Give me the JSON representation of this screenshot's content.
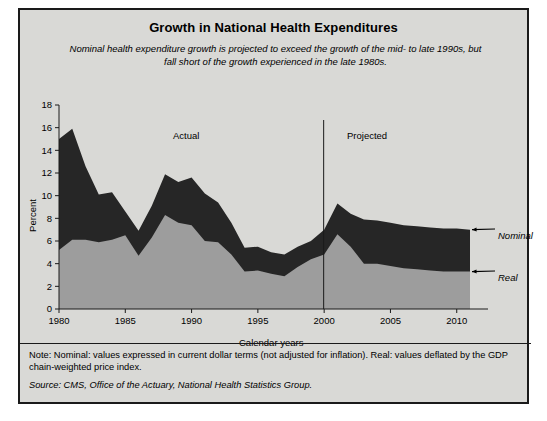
{
  "figure": {
    "title": "Growth in National Health Expenditures",
    "subtitle": "Nominal health expenditure growth is projected to exceed the growth of the mid- to late 1990s, but fall short of the growth experienced in the late 1980s.",
    "note": "Note: Nominal: values expressed in current dollar terms (not adjusted for inflation). Real: values deflated by the GDP chain-weighted price index.",
    "source": "Source: CMS, Office of the Actuary, National Health Statistics Group.",
    "background_color": "#d9d9d6",
    "border_color": "#1a1a1a"
  },
  "annotations": {
    "actual_label": "Actual",
    "projected_label": "Projected",
    "nominal_label": "Nominal",
    "real_label": "Real",
    "divider_year": 2000
  },
  "chart_data": {
    "type": "area",
    "title": "Growth in National Health Expenditures",
    "xlabel": "Calendar years",
    "ylabel": "Percent",
    "ylim": [
      0,
      18
    ],
    "xlim": [
      1980,
      2011
    ],
    "ytick_step": 2,
    "yticks": [
      0,
      2,
      4,
      6,
      8,
      10,
      12,
      14,
      16,
      18
    ],
    "xticks": [
      1980,
      1985,
      1990,
      1995,
      2000,
      2005,
      2010
    ],
    "grid": false,
    "legend": "inline-arrow-labels",
    "colors": {
      "nominal": "#262626",
      "real": "#9d9d9d"
    },
    "x": [
      1980,
      1981,
      1982,
      1983,
      1984,
      1985,
      1986,
      1987,
      1988,
      1989,
      1990,
      1991,
      1992,
      1993,
      1994,
      1995,
      1996,
      1997,
      1998,
      1999,
      2000,
      2001,
      2002,
      2003,
      2004,
      2005,
      2006,
      2007,
      2008,
      2009,
      2010,
      2011
    ],
    "series": [
      {
        "name": "Nominal",
        "values": [
          15.0,
          15.9,
          12.6,
          10.1,
          10.3,
          8.6,
          6.9,
          9.1,
          11.9,
          11.2,
          11.6,
          10.2,
          9.4,
          7.6,
          5.4,
          5.5,
          5.0,
          4.8,
          5.5,
          6.0,
          7.0,
          9.3,
          8.4,
          7.9,
          7.8,
          7.6,
          7.4,
          7.3,
          7.2,
          7.1,
          7.1,
          7.0
        ]
      },
      {
        "name": "Real",
        "values": [
          5.2,
          6.1,
          6.1,
          5.9,
          6.1,
          6.5,
          4.7,
          6.3,
          8.3,
          7.6,
          7.4,
          6.0,
          5.9,
          4.8,
          3.3,
          3.4,
          3.1,
          2.9,
          3.7,
          4.4,
          4.8,
          6.6,
          5.5,
          4.0,
          4.0,
          3.8,
          3.6,
          3.5,
          3.4,
          3.3,
          3.3,
          3.3
        ]
      }
    ]
  }
}
